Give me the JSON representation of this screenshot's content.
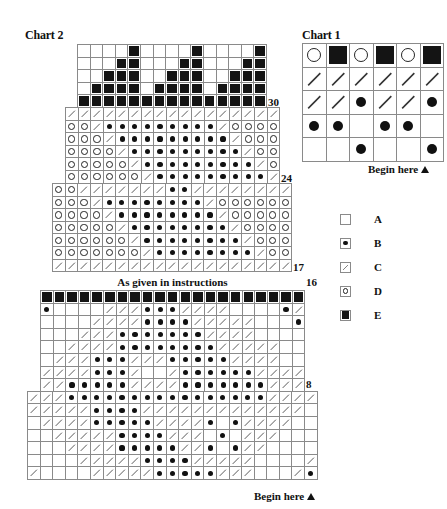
{
  "chart2": {
    "title": "Chart 2",
    "begin_label": "Begin here",
    "instructions_label": "As given in instructions",
    "row_labels": {
      "r30": "30",
      "r24": "24",
      "r17": "17",
      "r16": "16",
      "r8": "8"
    },
    "sections": [
      {
        "id": "crown",
        "left": 77,
        "top": 44,
        "cell": 12.6,
        "rows": [
          "AAAAEAAAAEAAAAE",
          "AAAEEAAAEEAAAEE",
          "AAEEEAAEEEAAEEE",
          "AEEEEAEEEEAEEEE",
          "EEEEEEEEEEEEEEE"
        ]
      },
      {
        "id": "upper-body",
        "left": 65,
        "top": 107,
        "cell": 12.6,
        "rows": [
          "CCCCCCCCCCCCCCCCC",
          "DDCBBBBBBBBBCDDDD",
          "DDDCBBBBBBBBBCDDD",
          "DDDDCBBBBBBBBBCDD",
          "DDDDDCBBBBBBBBBCD",
          "DDDDDDCBBBBBBBBBC"
        ]
      },
      {
        "id": "middle-body",
        "left": 52,
        "top": 183,
        "cell": 12.6,
        "rows": [
          "DDCCCCCCCBBCCCCCCCC",
          "DDDCBBBBBBBBCDDDDDD",
          "DDDDCBBBBBBBBCDDDDD",
          "DDDDDCBBBBBBBBCDDDD",
          "DDDDDDCBBBBBBBBCDDD",
          "DDDDDDDCBBBBBBBBCDD",
          "CCCCCCCCCCCCCCCCCCC"
        ]
      },
      {
        "id": "border-row",
        "left": 40,
        "top": 290,
        "cell": 12.6,
        "rows": [
          "EEEEEEEEEEEEEEEEEEEEE"
        ]
      },
      {
        "id": "lower-body",
        "left": 40,
        "top": 302.6,
        "cell": 12.6,
        "rows": [
          "BAAAACCCBBBCCCCAAAABC",
          "AAAACCCCBBBBCCCCCAAAB",
          "AAACCCBBBBBBBCCCCAAAA",
          "AACCCCBBBBBBBBCCCCCAA",
          "ACCCBBBCCCBBBBBCCCCAA",
          "CCCCBBBCAACBBBBBBCCCC",
          "CCBBBBBCCCCBBBBBBBCCC"
        ]
      },
      {
        "id": "base",
        "left": 27,
        "top": 390.8,
        "cell": 12.6,
        "rows": [
          "CCCBBBBBBBBBBBBBBBBCCCC",
          "CCCCCBBBBCCCCCCCCCCCCCA",
          "ACCCCBBBBBCCCCBABCCCCAA",
          "AACCCCCBBBBCCCABACCCAAA",
          "AAACCCCBBBBBCCBABCCAAAA",
          "AAAACCCCCBBBBCCCCCAAAAC",
          "CAAAACCCCCBBBBBCCCAAACB"
        ]
      }
    ]
  },
  "chart1": {
    "title": "Chart 1",
    "begin_label": "Begin here",
    "rows": [
      "DEDEDE",
      "CCCCCC",
      "CCBCCB",
      "BBABBA",
      "AABAAB"
    ]
  },
  "legend": {
    "items": [
      {
        "symbol": "A",
        "label": "A"
      },
      {
        "symbol": "B",
        "label": "B"
      },
      {
        "symbol": "C",
        "label": "C"
      },
      {
        "symbol": "D",
        "label": "D"
      },
      {
        "symbol": "E",
        "label": "E"
      }
    ]
  }
}
